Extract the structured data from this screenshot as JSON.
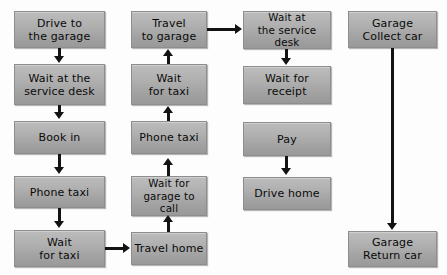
{
  "diagram": {
    "background_color": "#fdfdfd",
    "node_fill_color": "#b0b0b0",
    "node_border_color": "#8d8d8d",
    "arrow_color": "#131313",
    "columns": [
      {
        "name": "column-1",
        "nodes": [
          {
            "id": "drive-to-the-garage",
            "label": "Drive to\nthe garage"
          },
          {
            "id": "wait-at-the-service-desk",
            "label": "Wait at the\nservice desk"
          },
          {
            "id": "book-in",
            "label": "Book in"
          },
          {
            "id": "phone-taxi",
            "label": "Phone taxi"
          },
          {
            "id": "wait-for-taxi",
            "label": "Wait\nfor taxi"
          }
        ]
      },
      {
        "name": "column-2",
        "nodes": [
          {
            "id": "travel-to-garage",
            "label": "Travel\nto garage"
          },
          {
            "id": "wait-for-taxi-2",
            "label": "Wait\nfor taxi"
          },
          {
            "id": "phone-taxi-2",
            "label": "Phone taxi"
          },
          {
            "id": "wait-for-garage-to-call",
            "label": "Wait for\ngarage to call"
          },
          {
            "id": "travel-home",
            "label": "Travel home"
          }
        ]
      },
      {
        "name": "column-3",
        "nodes": [
          {
            "id": "wait-at-the-service-desk-2",
            "label": "Wait at\nthe service desk"
          },
          {
            "id": "wait-for-receipt",
            "label": "Wait for\nreceipt"
          },
          {
            "id": "pay",
            "label": "Pay"
          },
          {
            "id": "drive-home",
            "label": "Drive home"
          }
        ]
      },
      {
        "name": "column-4",
        "nodes": [
          {
            "id": "garage-collect-car",
            "label": "Garage\nCollect car"
          },
          {
            "id": "garage-return-car",
            "label": "Garage\nReturn car"
          }
        ]
      }
    ],
    "connections": [
      {
        "from": "drive-to-the-garage",
        "to": "wait-at-the-service-desk",
        "direction": "down"
      },
      {
        "from": "wait-at-the-service-desk",
        "to": "book-in",
        "direction": "down"
      },
      {
        "from": "book-in",
        "to": "phone-taxi",
        "direction": "down"
      },
      {
        "from": "phone-taxi",
        "to": "wait-for-taxi",
        "direction": "down"
      },
      {
        "from": "wait-for-taxi",
        "to": "travel-home",
        "direction": "right"
      },
      {
        "from": "travel-home",
        "to": "wait-for-garage-to-call",
        "direction": "up"
      },
      {
        "from": "wait-for-garage-to-call",
        "to": "phone-taxi-2",
        "direction": "up"
      },
      {
        "from": "phone-taxi-2",
        "to": "wait-for-taxi-2",
        "direction": "up"
      },
      {
        "from": "wait-for-taxi-2",
        "to": "travel-to-garage",
        "direction": "up"
      },
      {
        "from": "travel-to-garage",
        "to": "wait-at-the-service-desk-2",
        "direction": "right"
      },
      {
        "from": "wait-at-the-service-desk-2",
        "to": "wait-for-receipt",
        "direction": "down"
      },
      {
        "from": "pay",
        "to": "drive-home",
        "direction": "down"
      },
      {
        "from": "garage-collect-car",
        "to": "garage-return-car",
        "direction": "down"
      }
    ]
  }
}
